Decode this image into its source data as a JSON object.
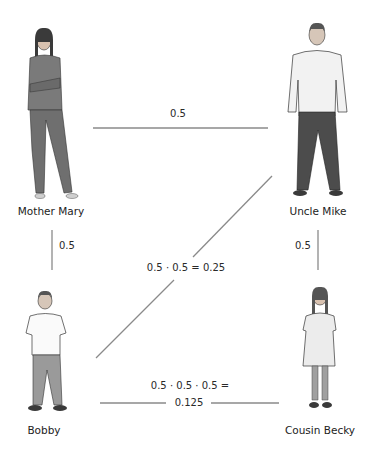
{
  "diagram": {
    "title": "",
    "people": [
      {
        "id": "mother",
        "name": "Mother Mary",
        "clothing": "#7a7a7a",
        "pants": "#6f6f6f"
      },
      {
        "id": "uncle",
        "name": "Uncle Mike",
        "clothing": "#f2f2f2",
        "pants": "#4c4c4c"
      },
      {
        "id": "bobby",
        "name": "Bobby",
        "clothing": "#fafafa",
        "pants": "#9a9a9a"
      },
      {
        "id": "becky",
        "name": "Cousin Becky",
        "clothing": "#ececec",
        "pants": "#9a9a9a"
      }
    ],
    "edges": [
      {
        "from": "mother",
        "to": "uncle",
        "label": "0.5"
      },
      {
        "from": "mother",
        "to": "bobby",
        "label": "0.5"
      },
      {
        "from": "uncle",
        "to": "becky",
        "label": "0.5"
      },
      {
        "from": "bobby",
        "to": "uncle",
        "label": "0.5 · 0.5 = 0.25"
      },
      {
        "from": "bobby",
        "to": "becky",
        "label_line1": "0.5 · 0.5 · 0.5 =",
        "label_line2": "0.125"
      }
    ],
    "line_color": "#8a8a8a"
  }
}
